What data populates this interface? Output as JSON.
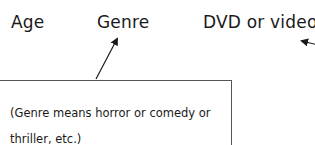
{
  "labels": {
    "age": "Age",
    "genre": "Genre",
    "dvd": "DVD or video"
  },
  "note": {
    "text": "(Genre means horror or comedy or thriller, etc.)"
  },
  "colors": {
    "text": "#1a1a1a",
    "border": "#555555"
  }
}
